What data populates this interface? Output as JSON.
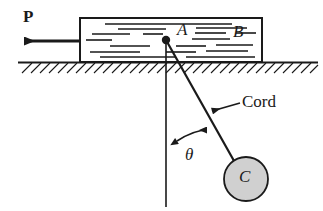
{
  "figure": {
    "type": "free-body-mechanics-diagram",
    "background_color": "#ffffff",
    "line_color": "#1a1a1a",
    "ball_fill_color": "#d0d0d0"
  },
  "labels": {
    "force": "P",
    "point_a": "A",
    "block": "B",
    "cord": "Cord",
    "angle": "θ",
    "ball": "C"
  },
  "geometry": {
    "block": {
      "x": 80,
      "y": 18,
      "width": 182,
      "height": 44
    },
    "ground_line_y": 62,
    "force_arrow": {
      "from_x": 80,
      "to_x": 20,
      "y": 41
    },
    "point_a": {
      "x": 166,
      "y": 40
    },
    "vertical_reference": {
      "x": 166,
      "from_y": 40,
      "to_y": 207
    },
    "cord": {
      "from_x": 166,
      "from_y": 40,
      "to_x": 236,
      "to_y": 166
    },
    "ball": {
      "cx": 246,
      "cy": 179,
      "r": 22
    },
    "angle_arc": {
      "from_x": 175,
      "from_y": 141,
      "to_x": 209,
      "to_y": 129
    },
    "cord_leader": {
      "from_x": 238,
      "from_y": 104,
      "to_x": 210,
      "to_y": 112
    }
  }
}
